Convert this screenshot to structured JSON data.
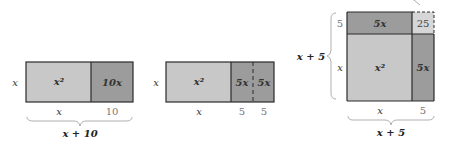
{
  "colors": {
    "light_region": "#c8c8c8",
    "medium_region": "#9c9c9c",
    "small_square": "#d6d6d6",
    "border": "#2a2a2a",
    "brace": "#b0b0b0"
  },
  "figures": [
    {
      "id": "fig1",
      "left_label": "x",
      "regions": [
        {
          "label": "x²",
          "color": "light"
        },
        {
          "label": "10x",
          "color": "medium"
        }
      ],
      "bottom_labels": [
        "x",
        "10"
      ],
      "brace_label": "x + 10"
    },
    {
      "id": "fig2",
      "left_label": "x",
      "regions": [
        {
          "label": "x²",
          "color": "light"
        },
        {
          "label": "5x",
          "color": "medium"
        },
        {
          "label": "5x",
          "color": "medium"
        }
      ],
      "bottom_labels": [
        "x",
        "5",
        "5"
      ]
    },
    {
      "id": "fig3",
      "left_brace_label": "x + 5",
      "left_labels": [
        "5",
        "x"
      ],
      "regions": [
        {
          "label": "5x",
          "color": "medium"
        },
        {
          "label": "25",
          "color": "small"
        },
        {
          "label": "x²",
          "color": "light"
        },
        {
          "label": "5x",
          "color": "medium"
        }
      ],
      "bottom_labels": [
        "x",
        "5"
      ],
      "brace_label": "x + 5"
    }
  ]
}
